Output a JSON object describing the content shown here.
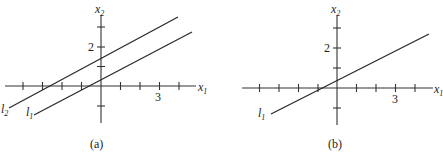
{
  "panels": [
    {
      "id": "a",
      "caption": "(a)",
      "x_axis_label": "x",
      "x_axis_sub": "1",
      "y_axis_label": "x",
      "y_axis_sub": "2",
      "x_tick_label": "3",
      "y_tick_label": "2",
      "lines": [
        {
          "name": "l",
          "sub": "2"
        },
        {
          "name": "l",
          "sub": "1"
        }
      ]
    },
    {
      "id": "b",
      "caption": "(b)",
      "x_axis_label": "x",
      "x_axis_sub": "1",
      "y_axis_label": "x",
      "y_axis_sub": "2",
      "x_tick_label": "3",
      "y_tick_label": "2",
      "lines": [
        {
          "name": "l",
          "sub": "1"
        }
      ]
    }
  ]
}
